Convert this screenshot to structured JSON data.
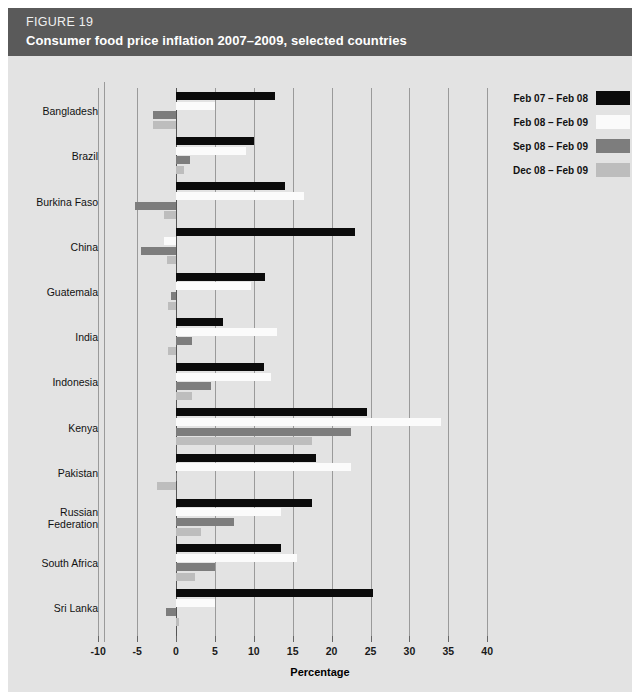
{
  "header": {
    "figure_number": "FIGURE 19",
    "title": "Consumer food price inflation 2007–2009, selected countries",
    "background_color": "#5a5a5a"
  },
  "chart_data": {
    "type": "bar",
    "orientation": "horizontal",
    "title": "Consumer food price inflation 2007–2009, selected countries",
    "xlabel": "Percentage",
    "ylabel": "",
    "xlim": [
      -10,
      40
    ],
    "xticks": [
      -10,
      -5,
      0,
      5,
      10,
      15,
      20,
      25,
      30,
      35,
      40
    ],
    "xtick_labels": [
      "-10",
      "-5",
      "0",
      "5",
      "10",
      "15",
      "20",
      "25",
      "30",
      "35",
      "40"
    ],
    "grid": true,
    "legend_position": "top-right",
    "categories": [
      "Bangladesh",
      "Brazil",
      "Burkina Faso",
      "China",
      "Guatemala",
      "India",
      "Indonesia",
      "Kenya",
      "Pakistan",
      "Russian\nFederation",
      "South Africa",
      "Sri Lanka"
    ],
    "series": [
      {
        "name": "Feb 07 – Feb 08",
        "color": "#0b0b0b",
        "values": [
          12.7,
          10.0,
          14.0,
          23.0,
          11.5,
          6.0,
          11.3,
          24.5,
          18.0,
          17.5,
          13.5,
          25.3
        ]
      },
      {
        "name": "Feb 08 – Feb 09",
        "color": "#fbfbfb",
        "values": [
          5.0,
          9.0,
          16.5,
          -1.5,
          9.7,
          13.0,
          12.2,
          34.0,
          22.5,
          13.5,
          15.5,
          5.0
        ]
      },
      {
        "name": "Sep 08 – Feb 09",
        "color": "#7d7d7d",
        "values": [
          -3.0,
          1.8,
          -5.3,
          -4.5,
          -0.6,
          2.0,
          4.5,
          22.5,
          0.0,
          7.5,
          5.0,
          -1.3
        ]
      },
      {
        "name": "Dec 08 – Feb 09",
        "color": "#bdbdbd",
        "values": [
          -3.0,
          1.0,
          -1.5,
          -1.2,
          -1.0,
          -1.0,
          2.0,
          17.5,
          -2.5,
          3.2,
          2.5,
          0.4
        ]
      }
    ]
  }
}
